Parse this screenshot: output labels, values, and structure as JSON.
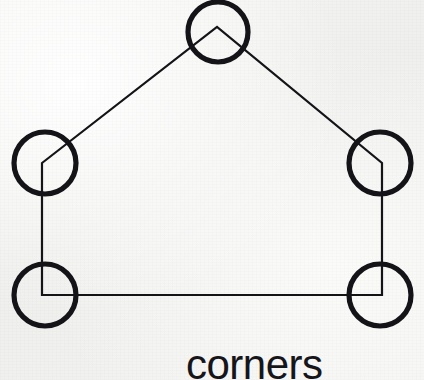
{
  "figure": {
    "caption": "corners",
    "caption_color": "#16161a",
    "stroke_color": "#141418",
    "background_color": "#f4f4f2",
    "shape_name": "pentagon-house-outline",
    "shape_stroke_width": 2,
    "marker_stroke_width": 5,
    "marker_shape": "circle",
    "marker_radius": 31,
    "marker_count": 5
  },
  "chart_data": {
    "type": "diagram",
    "title": "corners",
    "vertices": [
      {
        "name": "apex",
        "label": "top-apex-corner",
        "x": 217,
        "y": 27,
        "angle_type": "acute"
      },
      {
        "name": "upper-left",
        "label": "left-middle-corner",
        "x": 42,
        "y": 163,
        "angle_type": "obtuse"
      },
      {
        "name": "upper-right",
        "label": "right-middle-corner",
        "x": 382,
        "y": 163,
        "angle_type": "obtuse"
      },
      {
        "name": "lower-left",
        "label": "bottom-left-corner",
        "x": 42,
        "y": 295,
        "angle_type": "right"
      },
      {
        "name": "lower-right",
        "label": "bottom-right-corner",
        "x": 382,
        "y": 295,
        "angle_type": "right"
      }
    ],
    "edges": [
      {
        "from": "upper-left",
        "to": "apex"
      },
      {
        "from": "apex",
        "to": "upper-right"
      },
      {
        "from": "upper-right",
        "to": "lower-right"
      },
      {
        "from": "lower-right",
        "to": "lower-left"
      },
      {
        "from": "lower-left",
        "to": "upper-left"
      }
    ],
    "markers": [
      {
        "label": "corner-marker-apex",
        "cx": 218,
        "cy": 32,
        "r": 30
      },
      {
        "label": "corner-marker-left-middle",
        "cx": 45,
        "cy": 163,
        "r": 31
      },
      {
        "label": "corner-marker-right-middle",
        "cx": 380,
        "cy": 163,
        "r": 31
      },
      {
        "label": "corner-marker-bottom-left",
        "cx": 45,
        "cy": 295,
        "r": 31
      },
      {
        "label": "corner-marker-bottom-right",
        "cx": 380,
        "cy": 295,
        "r": 31
      }
    ],
    "xlabel": "",
    "ylabel": "",
    "grid": false,
    "legend": false
  }
}
